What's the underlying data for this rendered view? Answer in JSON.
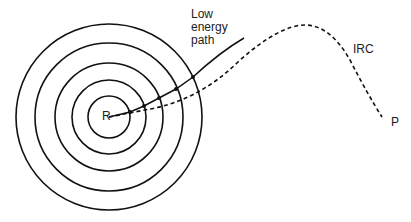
{
  "labels": {
    "low_energy_path": [
      "Low",
      "energy",
      "path"
    ],
    "irc": "IRC",
    "reactant": "R",
    "product": "P"
  },
  "colors": {
    "line": "#111111",
    "background": "#ffffff"
  },
  "contours": {
    "center": [
      109,
      117
    ],
    "radii": [
      21,
      37,
      54,
      74,
      93
    ]
  }
}
